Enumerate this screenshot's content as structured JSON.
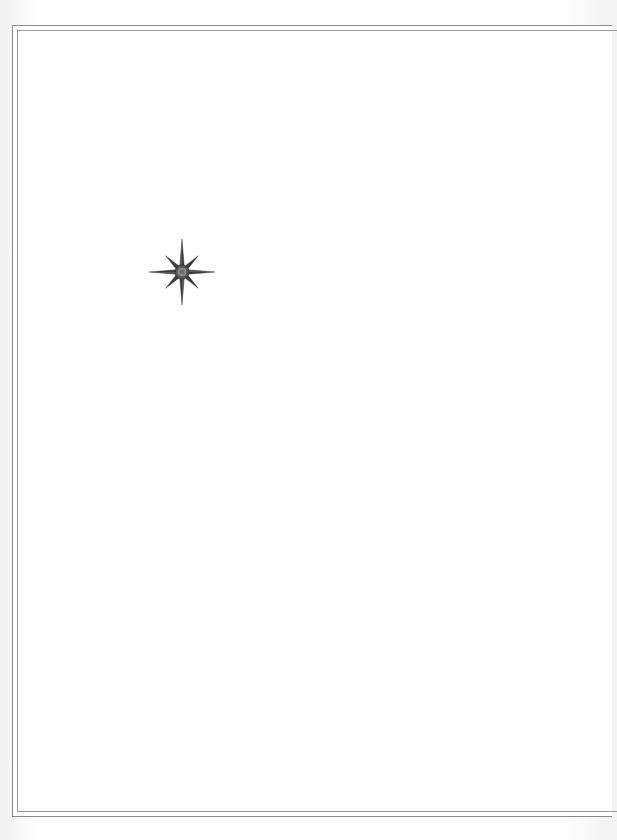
{
  "map": {
    "title": "",
    "background_color": "#ffffff",
    "border": {
      "style": "double-line",
      "color": "#8a8a8a"
    },
    "compass_rose": {
      "icon": "compass-rose-icon",
      "points": 8,
      "color": "#3a3a3a",
      "center_color": "#7a7a7a",
      "position": {
        "x": 182,
        "y": 272
      }
    }
  }
}
